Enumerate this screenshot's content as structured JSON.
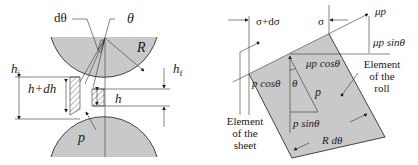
{
  "left_figure": {
    "labels": {
      "d_theta": "dθ",
      "theta": "θ",
      "radius": "R",
      "h_initial": "h",
      "h_initial_sub": "i",
      "h_final": "h",
      "h_final_sub": "f",
      "h_plus_dh": "h+dh",
      "h": "h",
      "pressure": "p"
    }
  },
  "right_figure": {
    "labels": {
      "sigma_plus_dsigma": "σ+dσ",
      "sigma": "σ",
      "mu_p": "μp",
      "mu_p_sin": "μp sinθ",
      "mu_p_cos": "μp cosθ",
      "p_cos": "p cosθ",
      "theta": "θ",
      "p": "p",
      "p_sin": "p sinθ",
      "r_dtheta": "R dθ",
      "element_roll": [
        "Element",
        "of the",
        "roll"
      ],
      "element_sheet": [
        "Element",
        "of the",
        "sheet"
      ]
    }
  },
  "colors": {
    "roll_fill": "#c9c9c9",
    "line": "#1a1a1a"
  }
}
